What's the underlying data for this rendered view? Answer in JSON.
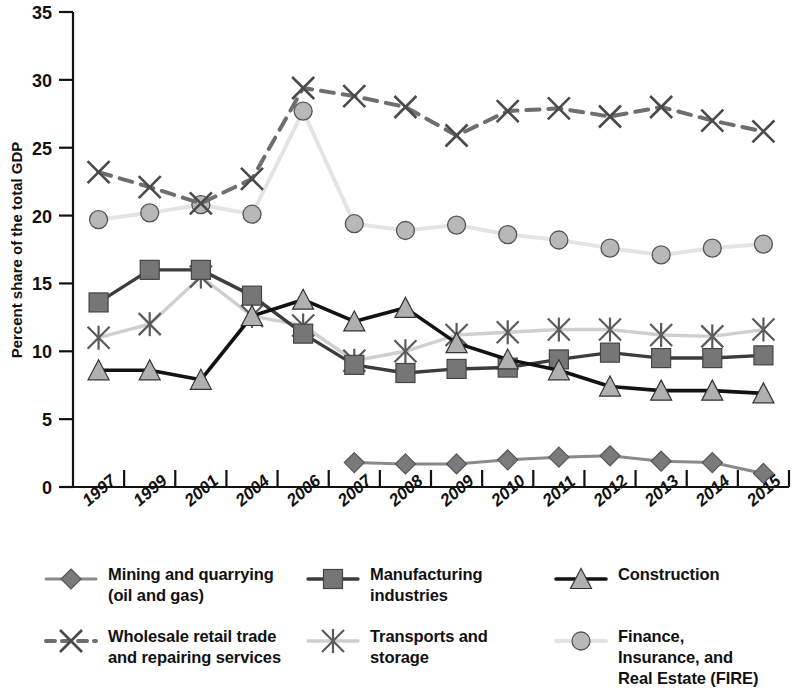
{
  "chart_data": {
    "type": "line",
    "title": "",
    "xlabel": "",
    "ylabel": "Percent share of the total GDP",
    "ylim": [
      0,
      35
    ],
    "yticks": [
      0,
      5,
      10,
      15,
      20,
      25,
      30,
      35
    ],
    "grid": false,
    "legend_position": "bottom",
    "categories": [
      "1997",
      "1999",
      "2001",
      "2004",
      "2006",
      "2007",
      "2008",
      "2009",
      "2010",
      "2011",
      "2012",
      "2013",
      "2014",
      "2015"
    ],
    "x_tick_labels": [
      "1997",
      "1999",
      "2001",
      "2004",
      "2006",
      "2007",
      "2008",
      "2009",
      "2010",
      "2011",
      "2012",
      "2013",
      "2014",
      "2015"
    ],
    "series": [
      {
        "name": "Mining and quarrying (oil and gas)",
        "marker": "diamond",
        "line_style": "solid",
        "color": "#8a8a8a",
        "marker_fill": "#7a7a7a",
        "values": [
          null,
          null,
          null,
          null,
          null,
          1.8,
          1.7,
          1.7,
          2.0,
          2.2,
          2.3,
          1.9,
          1.8,
          1.0
        ]
      },
      {
        "name": "Manufacturing industries",
        "marker": "square",
        "line_style": "solid",
        "color": "#3c3c3c",
        "marker_fill": "#767676",
        "values": [
          13.6,
          16.0,
          16.0,
          14.1,
          11.3,
          9.0,
          8.4,
          8.7,
          8.8,
          9.4,
          9.9,
          9.5,
          9.5,
          9.7
        ]
      },
      {
        "name": "Construction",
        "marker": "triangle",
        "line_style": "solid",
        "color": "#121212",
        "marker_fill": "#b0b0b0",
        "values": [
          8.6,
          8.6,
          7.9,
          12.6,
          13.8,
          12.2,
          13.2,
          10.6,
          9.4,
          8.6,
          7.4,
          7.1,
          7.1,
          6.9
        ]
      },
      {
        "name": "Wholesale retail trade and repairing services",
        "marker": "x",
        "line_style": "dashed",
        "color": "#6e6e6e",
        "marker_fill": "#4a4a4a",
        "values": [
          23.2,
          22.1,
          20.9,
          22.7,
          29.4,
          28.8,
          28.0,
          25.9,
          27.7,
          27.9,
          27.3,
          28.0,
          27.0,
          26.2
        ]
      },
      {
        "name": "Transports and storage",
        "marker": "asterisk",
        "line_style": "solid",
        "color": "#cfcfcf",
        "marker_fill": "#5a5a5a",
        "values": [
          11.0,
          12.0,
          15.5,
          12.6,
          11.9,
          9.3,
          10.0,
          11.2,
          11.4,
          11.6,
          11.6,
          11.2,
          11.1,
          11.6
        ]
      },
      {
        "name": "Finance, Insurance, and Real Estate (FIRE)",
        "marker": "circle",
        "line_style": "solid",
        "color": "#e4e4e4",
        "marker_fill": "#b8b8b8",
        "values": [
          19.7,
          20.2,
          20.8,
          20.1,
          27.7,
          19.4,
          18.9,
          19.3,
          18.6,
          18.2,
          17.6,
          17.1,
          17.6,
          17.9
        ]
      }
    ]
  },
  "legend": {
    "items": [
      {
        "label": "Mining and quarrying\n(oil and gas)",
        "marker": "diamond",
        "line_style": "solid",
        "color": "#8a8a8a",
        "marker_fill": "#7a7a7a"
      },
      {
        "label": "Manufacturing\nindustries",
        "marker": "square",
        "line_style": "solid",
        "color": "#3c3c3c",
        "marker_fill": "#767676"
      },
      {
        "label": "Construction",
        "marker": "triangle",
        "line_style": "solid",
        "color": "#121212",
        "marker_fill": "#b0b0b0"
      },
      {
        "label": "Wholesale retail trade\nand repairing services",
        "marker": "x",
        "line_style": "dashed",
        "color": "#6e6e6e",
        "marker_fill": "#4a4a4a"
      },
      {
        "label": "Transports and\nstorage",
        "marker": "asterisk",
        "line_style": "solid",
        "color": "#cfcfcf",
        "marker_fill": "#5a5a5a"
      },
      {
        "label": "Finance, Insurance, and\nReal Estate (FIRE)",
        "marker": "circle",
        "line_style": "solid",
        "color": "#e4e4e4",
        "marker_fill": "#b8b8b8"
      }
    ]
  }
}
